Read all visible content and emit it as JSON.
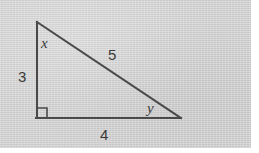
{
  "figure": {
    "kind": "right-triangle",
    "background_color": "#d4d4d4",
    "page_color": "#ffffff",
    "stroke_color": "#4a4a4a",
    "stroke_width": 2,
    "plate": {
      "width": 251,
      "height": 148
    },
    "vertices": {
      "apex": {
        "x": 37,
        "y": 22
      },
      "right_angle": {
        "x": 37,
        "y": 118
      },
      "right": {
        "x": 180,
        "y": 118
      }
    },
    "right_angle_marker": {
      "x": 37,
      "y": 118,
      "size": 10
    }
  },
  "labels": {
    "angle_top": {
      "text": "x",
      "x": 41,
      "y": 36,
      "style": "italic"
    },
    "angle_right": {
      "text": "y",
      "x": 147,
      "y": 101,
      "style": "italic"
    },
    "side_vertical": {
      "text": "3",
      "x": 18,
      "y": 69,
      "style": "upright"
    },
    "side_hypotenuse": {
      "text": "5",
      "x": 108,
      "y": 47,
      "style": "upright"
    },
    "side_horizontal": {
      "text": "4",
      "x": 100,
      "y": 127,
      "style": "upright"
    }
  }
}
